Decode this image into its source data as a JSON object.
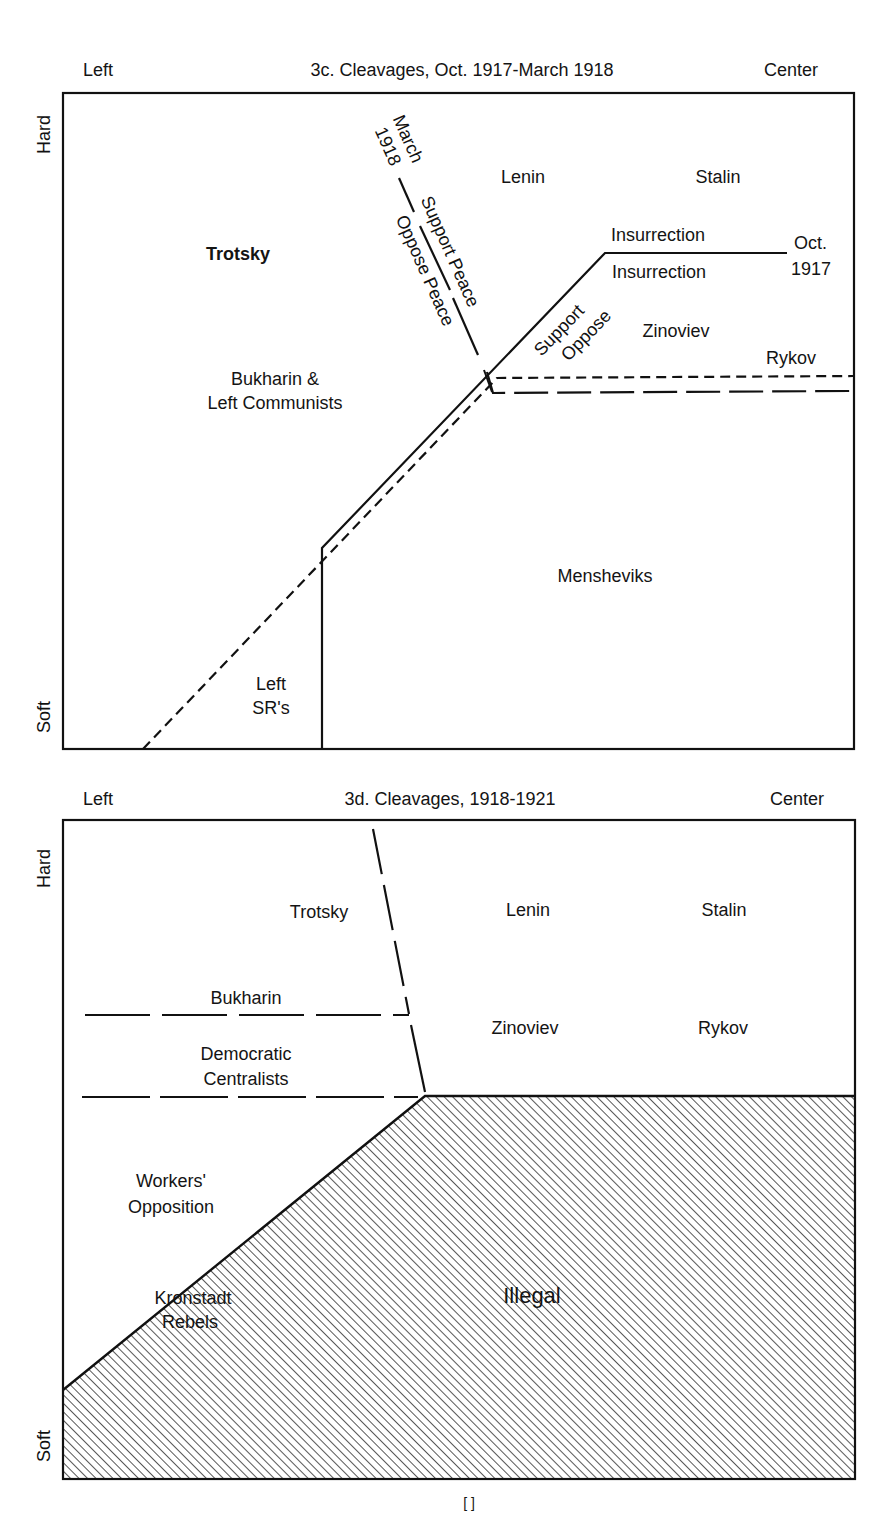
{
  "figure_3c": {
    "title": "3c. Cleavages, Oct. 1917-March 1918",
    "axis_left": "Left",
    "axis_right": "Center",
    "axis_top": "Hard",
    "axis_bottom": "Soft",
    "labels": {
      "trotsky": "Trotsky",
      "lenin": "Lenin",
      "stalin": "Stalin",
      "bukharin_line1": "Bukharin &",
      "bukharin_line2": "Left Communists",
      "zinoviev": "Zinoviev",
      "rykov": "Rykov",
      "mensheviks": "Mensheviks",
      "left_srs_line1": "Left",
      "left_srs_line2": "SR's",
      "support_insurrection": "Insurrection",
      "oppose_insurrection": "Insurrection",
      "support": "Support",
      "oppose": "Oppose",
      "oct_line1": "Oct.",
      "oct_line2": "1917",
      "march_line1": "March",
      "march_line2": "1918",
      "support_peace": "Support Peace",
      "oppose_peace": "Oppose Peace"
    }
  },
  "figure_3d": {
    "title": "3d. Cleavages, 1918-1921",
    "axis_left": "Left",
    "axis_right": "Center",
    "axis_top": "Hard",
    "axis_bottom": "Soft",
    "labels": {
      "trotsky": "Trotsky",
      "lenin": "Lenin",
      "stalin": "Stalin",
      "bukharin": "Bukharin",
      "zinoviev": "Zinoviev",
      "rykov": "Rykov",
      "democratic_line1": "Democratic",
      "democratic_line2": "Centralists",
      "workers_line1": "Workers'",
      "workers_line2": "Opposition",
      "kronstadt_line1": "Kronstadt",
      "kronstadt_line2": "Rebels",
      "illegal": "Illegal"
    }
  },
  "page_number": "[ ]"
}
